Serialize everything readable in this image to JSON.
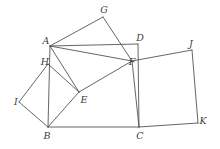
{
  "figure": {
    "kind": "geometry-diagram",
    "caption": "",
    "canvas": {
      "width": 220,
      "height": 149
    },
    "stroke_color": "#4a4a4a",
    "label_color": "#3d3d3d",
    "background_color": "#ffffff",
    "vertices": [
      {
        "id": "A",
        "label": "A",
        "x": 50,
        "y": 46,
        "label_x": 46,
        "label_y": 41
      },
      {
        "id": "B",
        "label": "B",
        "x": 48,
        "y": 127,
        "label_x": 47,
        "label_y": 136
      },
      {
        "id": "C",
        "label": "C",
        "x": 139,
        "y": 127,
        "label_x": 140,
        "label_y": 136
      },
      {
        "id": "D",
        "label": "D",
        "x": 138,
        "y": 44,
        "label_x": 140,
        "label_y": 38
      },
      {
        "id": "E",
        "label": "E",
        "x": 79,
        "y": 92,
        "label_x": 84,
        "label_y": 100
      },
      {
        "id": "F",
        "label": "F",
        "x": 132,
        "y": 61,
        "label_x": 132,
        "label_y": 62
      },
      {
        "id": "G",
        "label": "G",
        "x": 103,
        "y": 17,
        "label_x": 104,
        "label_y": 10
      },
      {
        "id": "H",
        "label": "H",
        "x": 48,
        "y": 64,
        "label_x": 45,
        "label_y": 62
      },
      {
        "id": "I",
        "label": "I",
        "x": 19,
        "y": 102,
        "label_x": 16,
        "label_y": 102
      },
      {
        "id": "J",
        "label": "J",
        "x": 192,
        "y": 50,
        "label_x": 191,
        "label_y": 44
      },
      {
        "id": "K",
        "label": "K",
        "x": 198,
        "y": 123,
        "label_x": 203,
        "label_y": 121
      }
    ],
    "edges": [
      {
        "from": "A",
        "to": "G"
      },
      {
        "from": "G",
        "to": "F"
      },
      {
        "from": "A",
        "to": "D"
      },
      {
        "from": "D",
        "to": "C"
      },
      {
        "from": "A",
        "to": "B"
      },
      {
        "from": "A",
        "to": "E"
      },
      {
        "from": "A",
        "to": "F"
      },
      {
        "from": "H",
        "to": "I"
      },
      {
        "from": "I",
        "to": "B"
      },
      {
        "from": "H",
        "to": "E"
      },
      {
        "from": "E",
        "to": "B"
      },
      {
        "from": "E",
        "to": "F"
      },
      {
        "from": "B",
        "to": "C"
      },
      {
        "from": "F",
        "to": "C"
      },
      {
        "from": "F",
        "to": "J"
      },
      {
        "from": "J",
        "to": "K"
      },
      {
        "from": "K",
        "to": "C"
      }
    ]
  }
}
